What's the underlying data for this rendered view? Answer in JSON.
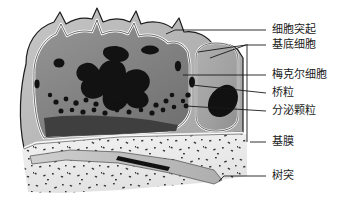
{
  "figure": {
    "background_color": "#ffffff",
    "line_color": "#1a1a1a",
    "text_color": "#1a1a1a"
  },
  "palette": {
    "outer_cell_light_gray": "#b9b9b9",
    "merkel_cell_mid_gray": "#8d8d8d",
    "merkel_cell_dark_gray": "#6e6e6e",
    "basal_cell_gray": "#a3a3a3",
    "nucleus_black": "#131313",
    "dermis_light": "#efefef",
    "dermis_speckle": "#2b2b2b",
    "outline_white": "#ffffff",
    "outline_black": "#1a1a1a"
  },
  "labels": [
    {
      "id": "cell-process",
      "text": "细胞突起",
      "x": 272,
      "y": 27
    },
    {
      "id": "basal-cell",
      "text": "基底细胞",
      "x": 272,
      "y": 42
    },
    {
      "id": "merkel-cell",
      "text": "梅克尔细胞",
      "x": 272,
      "y": 72
    },
    {
      "id": "desmosome",
      "text": "桥粒",
      "x": 272,
      "y": 90
    },
    {
      "id": "secretory-granule",
      "text": "分泌颗粒",
      "x": 272,
      "y": 108
    },
    {
      "id": "basement-membrane",
      "text": "基膜",
      "x": 272,
      "y": 139
    },
    {
      "id": "dendrite",
      "text": "树突",
      "x": 272,
      "y": 173
    }
  ],
  "structures": [
    {
      "id": "outer-keratinocyte-layer",
      "name": "surrounding keratinocyte cytoplasm"
    },
    {
      "id": "merkel-cell-body",
      "name": "Merkel cell body with lobed nucleus"
    },
    {
      "id": "merkel-cell-nucleus",
      "name": "irregular lobed dark nucleus"
    },
    {
      "id": "secretory-granules",
      "name": "round dense-core granules along cell base"
    },
    {
      "id": "basal-cell-body",
      "name": "adjacent rounded basal cell"
    },
    {
      "id": "basal-cell-nucleus",
      "name": "dark oval nucleus of basal cell"
    },
    {
      "id": "desmosome-marks",
      "name": "small dark desmosome junctions on cell border"
    },
    {
      "id": "basement-membrane-band",
      "name": "thin band separating epidermis from dermis"
    },
    {
      "id": "dermis-region",
      "name": "speckled connective tissue of dermis"
    },
    {
      "id": "dendrite-process",
      "name": "elongated nerve dendrite in dermis"
    }
  ]
}
